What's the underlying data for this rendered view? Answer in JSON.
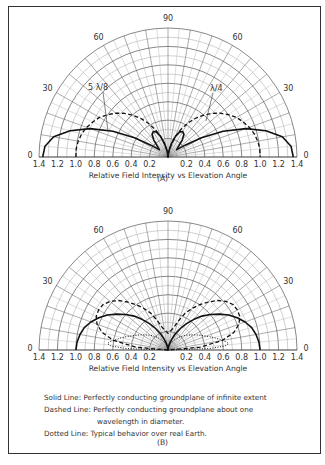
{
  "chart_data": [
    {
      "type": "polar",
      "panel": "(A)",
      "title": "Relative Field Intensity vs Elevation Angle",
      "xlabel": "Relative Field Intensity vs Elevation Angle",
      "angle_ticks": [
        "0",
        "30",
        "60",
        "90",
        "60",
        "30",
        "0"
      ],
      "radial_ticks": [
        "1.4",
        "1.2",
        "1.0",
        "0.8",
        "0.6",
        "0.4",
        "0.2",
        "",
        "0.2",
        "0.4",
        "0.6",
        "0.8",
        "1.0",
        "1.2",
        "1.4"
      ],
      "rmax": 1.4,
      "grid": true,
      "annotations": [
        "5 λ/8",
        "λ/4"
      ],
      "series": [
        {
          "name": "5 λ/8 (Solid)",
          "style": "solid",
          "angles_deg": [
            0,
            5,
            10,
            15,
            20,
            25,
            30,
            35,
            40,
            45,
            50,
            55,
            60,
            65,
            70,
            75,
            80,
            85,
            90
          ],
          "values": [
            1.36,
            1.34,
            1.26,
            1.1,
            0.9,
            0.66,
            0.42,
            0.22,
            0.12,
            0.16,
            0.24,
            0.3,
            0.32,
            0.3,
            0.24,
            0.16,
            0.08,
            0.03,
            0.0
          ]
        },
        {
          "name": "λ/4 (Dashed)",
          "style": "dashed",
          "angles_deg": [
            0,
            5,
            10,
            15,
            20,
            25,
            30,
            35,
            40,
            45,
            50,
            55,
            60,
            65,
            70,
            75,
            80,
            85,
            90
          ],
          "values": [
            1.0,
            1.0,
            0.99,
            0.97,
            0.94,
            0.9,
            0.86,
            0.8,
            0.74,
            0.67,
            0.59,
            0.51,
            0.42,
            0.33,
            0.24,
            0.15,
            0.08,
            0.03,
            0.0
          ]
        }
      ]
    },
    {
      "type": "polar",
      "panel": "(B)",
      "title": "Relative Field Intensity vs Elevation Angle",
      "xlabel": "Relative Field Intensity vs Elevation Angle",
      "angle_ticks": [
        "0",
        "30",
        "60",
        "90",
        "60",
        "30",
        "0"
      ],
      "radial_ticks": [
        "1.4",
        "1.2",
        "1.0",
        "0.8",
        "0.6",
        "0.4",
        "0.2",
        "",
        "0.2",
        "0.4",
        "0.6",
        "0.8",
        "1.0",
        "1.2",
        "1.4"
      ],
      "rmax": 1.4,
      "grid": true,
      "series": [
        {
          "name": "Solid Line",
          "style": "solid",
          "angles_deg": [
            0,
            5,
            10,
            15,
            20,
            25,
            30,
            35,
            40,
            45,
            50,
            55,
            60,
            65,
            70,
            75,
            80,
            85,
            90
          ],
          "values": [
            1.0,
            0.99,
            0.97,
            0.94,
            0.89,
            0.83,
            0.76,
            0.68,
            0.6,
            0.52,
            0.43,
            0.35,
            0.27,
            0.2,
            0.13,
            0.08,
            0.04,
            0.01,
            0.0
          ]
        },
        {
          "name": "Dashed Line",
          "style": "dashed",
          "angles_deg": [
            0,
            5,
            10,
            15,
            20,
            25,
            30,
            35,
            40,
            45,
            50,
            55,
            60,
            65,
            70,
            75,
            80,
            85,
            90
          ],
          "values": [
            0.0,
            0.35,
            0.6,
            0.74,
            0.82,
            0.86,
            0.87,
            0.86,
            0.82,
            0.76,
            0.68,
            0.6,
            0.52,
            0.44,
            0.34,
            0.26,
            0.22,
            0.2,
            0.18
          ]
        },
        {
          "name": "Dotted Line",
          "style": "dotted",
          "angles_deg": [
            0,
            2,
            4,
            6,
            8,
            10,
            15,
            20,
            25,
            30,
            40,
            50,
            60,
            70,
            80,
            90
          ],
          "values": [
            0.0,
            0.45,
            0.62,
            0.66,
            0.64,
            0.6,
            0.52,
            0.44,
            0.38,
            0.33,
            0.25,
            0.18,
            0.12,
            0.07,
            0.03,
            0.0
          ]
        }
      ]
    }
  ],
  "legend": {
    "solid": "Solid Line: Perfectly conducting groundplane of infinite extent",
    "dashed": "Dashed Line: Perfectly conducting groundplane about one",
    "dashed_cont": "wavelength in diameter.",
    "dotted": "Dotted Line: Typical behavior over real Earth."
  },
  "panel_a_label": "(A)",
  "panel_b_label": "(B)"
}
